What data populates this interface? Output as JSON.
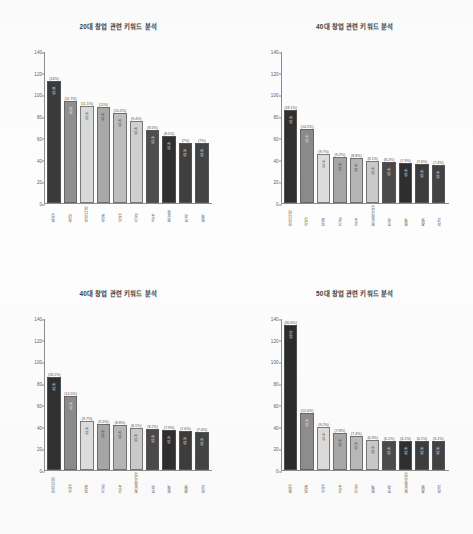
{
  "document": {
    "type": "scanned-report-page",
    "layout": "2x2 grid of bar charts"
  },
  "chart_data": [
    {
      "type": "bar",
      "panel": "top-left",
      "title": "20대 창업 관련 키워드 분석",
      "xlabel": "",
      "ylabel": "",
      "ylim": [
        0,
        140
      ],
      "yticks": [
        0,
        20,
        40,
        60,
        80,
        100,
        120,
        140
      ],
      "grid": false,
      "legend": "none",
      "categories": [
        "취업",
        "청년",
        "아이디어",
        "지원",
        "사업",
        "기술",
        "교육",
        "정보화",
        "투자",
        "정책"
      ],
      "values": [
        113,
        95,
        90,
        89,
        83,
        76,
        68,
        62,
        56,
        56
      ],
      "labels_pct": [
        "(14%)",
        "(11.7%)",
        "(11.1%)",
        "(11%)",
        "(10.2%)",
        "(9.4%)",
        "(8.5%)",
        "(8.5%)",
        "(7%)",
        "(7%)"
      ],
      "bar_colors": [
        "#3a3a3a",
        "#8f8f8f",
        "#d9d9d9",
        "#a8a8a8",
        "#bdbdbd",
        "#cfcfcf",
        "#4e4e4e",
        "#303030",
        "#3f3f3f",
        "#444444"
      ],
      "bar_value_text": [
        "취업",
        "청년",
        "사업",
        "사업",
        "사업",
        "사업",
        "사업",
        "사업",
        "사업",
        "사업"
      ]
    },
    {
      "type": "bar",
      "panel": "top-right",
      "title": "40대 창업 관련 키워드 분석",
      "xlabel": "",
      "ylabel": "",
      "ylim": [
        0,
        140
      ],
      "yticks": [
        0,
        20,
        40,
        60,
        80,
        100,
        120,
        140
      ],
      "grid": false,
      "legend": "none",
      "categories": [
        "아이디어",
        "사업",
        "지원",
        "기술",
        "교육",
        "정보화사업",
        "투자",
        "정책",
        "경영",
        "자금"
      ],
      "values": [
        86,
        69,
        45,
        43,
        42,
        39,
        38,
        37,
        36,
        35
      ],
      "labels_pct": [
        "(18.1%)",
        "(14.5%)",
        "(9.7%)",
        "(9.2%)",
        "(8.8%)",
        "(8.1%)",
        "(8.2%)",
        "(7.9%)",
        "(7.6%)",
        "(7.4%)"
      ],
      "bar_colors": [
        "#303030",
        "#8a8a8a",
        "#dcdcdc",
        "#a5a5a5",
        "#b5b5b5",
        "#c9c9c9",
        "#4a4a4a",
        "#2e2e2e",
        "#3c3c3c",
        "#434343"
      ],
      "bar_value_text": [
        "사업",
        "사업",
        "사업",
        "사업",
        "사업",
        "사업",
        "사업",
        "사업",
        "사업",
        "사업"
      ]
    },
    {
      "type": "bar",
      "panel": "bottom-left",
      "title": "40대 창업 관련 키워드 분석",
      "xlabel": "",
      "ylabel": "",
      "ylim": [
        0,
        140
      ],
      "yticks": [
        0,
        20,
        40,
        60,
        80,
        100,
        120,
        140
      ],
      "grid": false,
      "legend": "none",
      "categories": [
        "아이디어",
        "사업",
        "지원",
        "기술",
        "교육",
        "정보화사업",
        "투자",
        "정책",
        "경영",
        "자금"
      ],
      "values": [
        86,
        69,
        45,
        43,
        42,
        39,
        38,
        37,
        36,
        35
      ],
      "labels_pct": [
        "(18.1%)",
        "(14.5%)",
        "(9.7%)",
        "(9.2%)",
        "(8.8%)",
        "(8.1%)",
        "(8.2%)",
        "(7.9%)",
        "(7.6%)",
        "(7.4%)"
      ],
      "bar_colors": [
        "#303030",
        "#8a8a8a",
        "#dcdcdc",
        "#a5a5a5",
        "#b5b5b5",
        "#c9c9c9",
        "#4a4a4a",
        "#2e2e2e",
        "#3c3c3c",
        "#434343"
      ],
      "bar_value_text": [
        "사업",
        "사업",
        "사업",
        "사업",
        "사업",
        "사업",
        "사업",
        "사업",
        "사업",
        "사업"
      ]
    },
    {
      "type": "bar",
      "panel": "bottom-right",
      "title": "50대 창업 관련 키워드 분석",
      "xlabel": "",
      "ylabel": "",
      "ylim": [
        0,
        140
      ],
      "yticks": [
        0,
        20,
        40,
        60,
        80,
        100,
        120,
        140
      ],
      "grid": false,
      "legend": "none",
      "categories": [
        "창업",
        "지원",
        "사업",
        "교육",
        "기술",
        "정책",
        "투자",
        "정보화사업",
        "경영",
        "자금"
      ],
      "values": [
        134,
        53,
        40,
        34,
        32,
        28,
        27,
        27,
        27,
        27
      ],
      "labels_pct": [
        "(30.6%)",
        "(12.0%)",
        "(9.2%)",
        "(7.8%)",
        "(7.4%)",
        "(6.3%)",
        "(6.1%)",
        "(6.1%)",
        "(6.1%)",
        "(6.1%)"
      ],
      "bar_colors": [
        "#2c2c2c",
        "#8d8d8d",
        "#dadada",
        "#a7a7a7",
        "#b8b8b8",
        "#c7c7c7",
        "#4b4b4b",
        "#2f2f2f",
        "#3d3d3d",
        "#424242"
      ],
      "bar_value_text": [
        "창업",
        "사업",
        "사업",
        "사업",
        "사업",
        "사업",
        "사업",
        "사업",
        "사업",
        "사업"
      ]
    }
  ]
}
